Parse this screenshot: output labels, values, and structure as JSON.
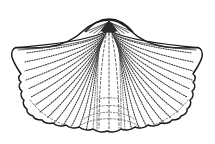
{
  "figure": {
    "title": "Fan-shaped brachiopod shell",
    "view": "exterior of pedicle valve",
    "caption": "",
    "technique": "stippled pen-and-ink line drawing",
    "background_color": "#ffffff",
    "ink_color": "#1a1a1a",
    "shade_color": "#2b2b2b"
  },
  "canvas": {
    "width": 215,
    "height": 144
  },
  "anatomy": {
    "umbo": {
      "label": "umbo",
      "apex_x": 109,
      "apex_y": 20
    },
    "delthyrium": {
      "label": "delthyrium",
      "fill": "#2b2b2b",
      "left_x": 103,
      "right_x": 116,
      "top_y": 22,
      "bottom_y": 31
    },
    "hinge_line": {
      "label": "hinge line",
      "left_tip_x": 20,
      "right_tip_x": 198,
      "y": 48
    },
    "left_wing": {
      "label": "left cardinal extremity",
      "tip_x": 20,
      "tip_y": 50
    },
    "right_wing": {
      "label": "right cardinal extremity",
      "tip_x": 198,
      "tip_y": 50
    },
    "anterior_margin": {
      "label": "crenulated anterior margin",
      "lowest_y": 132
    },
    "sulcus": {
      "label": "median sulcus",
      "top_y": 36,
      "bottom_y": 128
    },
    "costae": {
      "label": "radiating costae",
      "left_count": 17,
      "right_count": 17,
      "render": "dotted"
    },
    "growth_lines": {
      "label": "concentric growth lines",
      "count": 4
    }
  },
  "colors": {
    "outline": "#1a1a1a",
    "costae": "#3a3a3a",
    "faint_costae": "#575757",
    "growth": "#5a5a5a",
    "paper": "#ffffff"
  }
}
